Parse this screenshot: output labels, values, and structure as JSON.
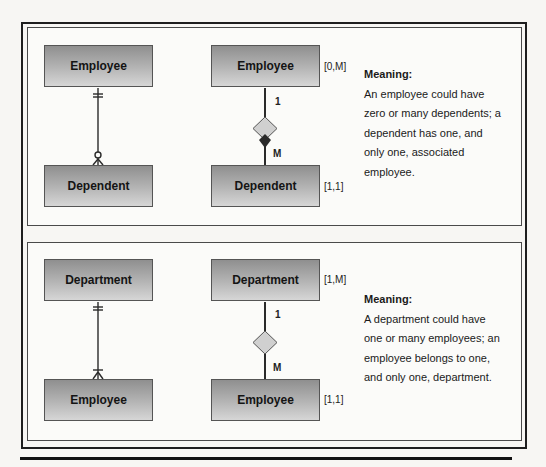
{
  "diagrams": [
    {
      "crows_foot": {
        "parent": "Employee",
        "child": "Dependent",
        "parent_notation": "one-and-only-one",
        "child_notation": "zero-or-many"
      },
      "chen": {
        "parent": "Employee",
        "child": "Dependent",
        "parent_cardinality": "[0,M]",
        "child_cardinality": "[1,1]",
        "parent_connectivity": "1",
        "child_connectivity": "M",
        "relationship_shape": "diamond"
      },
      "meaning": {
        "title": "Meaning:",
        "lines": [
          "An employee could have",
          "zero or many dependents; a",
          "dependent has one, and",
          "only one, associated",
          "employee."
        ]
      }
    },
    {
      "crows_foot": {
        "parent": "Department",
        "child": "Employee",
        "parent_notation": "one-and-only-one",
        "child_notation": "one-or-many"
      },
      "chen": {
        "parent": "Department",
        "child": "Employee",
        "parent_cardinality": "[1,M]",
        "child_cardinality": "[1,1]",
        "parent_connectivity": "1",
        "child_connectivity": "M",
        "relationship_shape": "diamond"
      },
      "meaning": {
        "title": "Meaning:",
        "lines": [
          "A department could have",
          "one or many employees; an",
          "employee belongs to one,",
          "and only one, department."
        ]
      }
    }
  ],
  "colors": {
    "entity_fill_top": "#8f8f8f",
    "entity_fill_bottom": "#d6d6d6",
    "diamond_fill": "#d0d0d0",
    "line": "#2a2a2a"
  }
}
